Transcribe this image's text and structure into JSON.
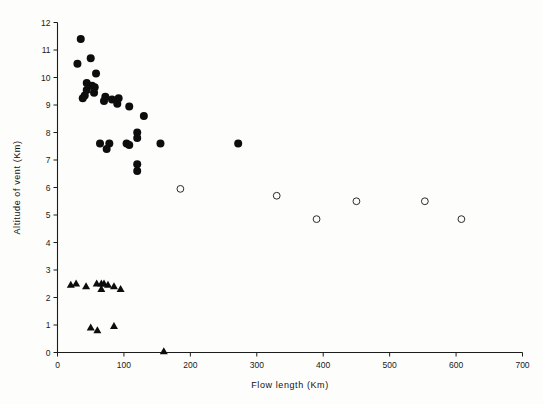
{
  "chart_data": {
    "type": "scatter",
    "title": "",
    "xlabel": "Flow length (Km)",
    "ylabel": "Altitude of vent (Km)",
    "xlim": [
      0,
      700
    ],
    "ylim": [
      0,
      12
    ],
    "xticks": [
      0,
      100,
      200,
      300,
      400,
      500,
      600,
      700
    ],
    "yticks": [
      0,
      1,
      2,
      3,
      4,
      5,
      6,
      7,
      8,
      9,
      10,
      11,
      12
    ],
    "xtick_labels": [
      "0",
      "100",
      "200",
      "300",
      "400",
      "500",
      "600",
      "700"
    ],
    "ytick_labels": [
      "0",
      "1",
      "2",
      "3",
      "4",
      "5",
      "6",
      "7",
      "8",
      "9",
      "10",
      "11",
      "12"
    ],
    "grid": false,
    "legend": "none",
    "series": [
      {
        "name": "filled-circles",
        "marker": "filled-circle",
        "color": "#0d0d0d",
        "points": [
          [
            35,
            11.4
          ],
          [
            30,
            10.5
          ],
          [
            50,
            10.7
          ],
          [
            58,
            10.15
          ],
          [
            44,
            9.8
          ],
          [
            44,
            9.55
          ],
          [
            41,
            9.35
          ],
          [
            38,
            9.25
          ],
          [
            52,
            9.7
          ],
          [
            56,
            9.65
          ],
          [
            55,
            9.45
          ],
          [
            72,
            9.3
          ],
          [
            70,
            9.15
          ],
          [
            82,
            9.2
          ],
          [
            92,
            9.25
          ],
          [
            90,
            9.05
          ],
          [
            108,
            8.95
          ],
          [
            130,
            8.6
          ],
          [
            64,
            7.6
          ],
          [
            78,
            7.6
          ],
          [
            74,
            7.4
          ],
          [
            104,
            7.6
          ],
          [
            108,
            7.55
          ],
          [
            120,
            8.0
          ],
          [
            120,
            7.8
          ],
          [
            120,
            6.85
          ],
          [
            120,
            6.6
          ],
          [
            155,
            7.6
          ],
          [
            272,
            7.6
          ]
        ]
      },
      {
        "name": "open-circles",
        "marker": "open-circle",
        "color": "#2a2a2a",
        "points": [
          [
            185,
            5.95
          ],
          [
            330,
            5.7
          ],
          [
            390,
            4.85
          ],
          [
            450,
            5.5
          ],
          [
            553,
            5.5
          ],
          [
            608,
            4.85
          ]
        ]
      },
      {
        "name": "triangles",
        "marker": "filled-triangle",
        "color": "#0d0d0d",
        "points": [
          [
            20,
            2.45
          ],
          [
            28,
            2.5
          ],
          [
            43,
            2.4
          ],
          [
            59,
            2.5
          ],
          [
            66,
            2.5
          ],
          [
            70,
            2.5
          ],
          [
            66,
            2.3
          ],
          [
            76,
            2.45
          ],
          [
            85,
            2.4
          ],
          [
            95,
            2.3
          ],
          [
            50,
            0.9
          ],
          [
            60,
            0.8
          ],
          [
            85,
            0.95
          ],
          [
            160,
            0.03
          ]
        ]
      }
    ]
  },
  "axes": {
    "x_title": "Flow length (Km)",
    "y_title": "Altitude of vent (Km)"
  }
}
